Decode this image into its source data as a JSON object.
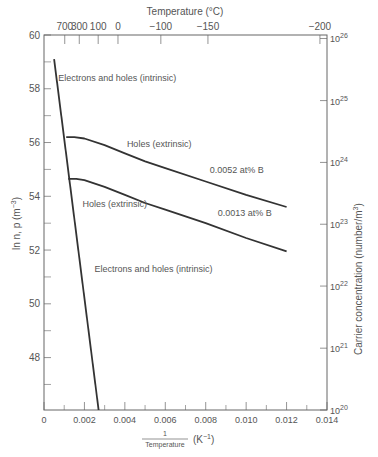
{
  "chart_data": {
    "type": "line",
    "title": "",
    "xlabel": "1/Temperature (K^-1)",
    "xlabel_parts": {
      "numerator": "1",
      "denominator": "Temperature",
      "unit": "(K",
      "unit_sup": "−1",
      "unit_close": ")"
    },
    "ylabel": "ln n, p (m^-3)",
    "ylabel_parts": {
      "main": "ln n, p (m",
      "sup": "−3",
      "close": ")"
    },
    "top_xlabel": "Temperature (°C)",
    "right_ylabel": "Carrier concentration (number/m^3)",
    "right_ylabel_parts": {
      "main": "Carrier concentration (number/m",
      "sup": "3",
      "close": ")"
    },
    "xlim": [
      0,
      0.014
    ],
    "ylim": [
      46.05,
      60
    ],
    "x_ticks": [
      "0",
      "0.002",
      "0.004",
      "0.006",
      "0.008",
      "0.010",
      "0.012",
      "0.014"
    ],
    "x_tick_values": [
      0,
      0.002,
      0.004,
      0.006,
      0.008,
      0.01,
      0.012,
      0.014
    ],
    "y_ticks": [
      "48",
      "50",
      "52",
      "54",
      "56",
      "58",
      "60"
    ],
    "y_tick_values": [
      48,
      50,
      52,
      54,
      56,
      58,
      60
    ],
    "top_ticks": [
      {
        "label": "700",
        "x": 0.001026
      },
      {
        "label": "300",
        "x": 0.001745
      },
      {
        "label": "100",
        "x": 0.00268
      },
      {
        "label": "0",
        "x": 0.00366
      },
      {
        "label": "−100",
        "x": 0.00578
      },
      {
        "label": "−150",
        "x": 0.00811
      },
      {
        "label": "−200",
        "x": 0.01365
      }
    ],
    "right_ticks": [
      {
        "base": "10",
        "exp": "20",
        "ln": 46.05
      },
      {
        "base": "10",
        "exp": "21",
        "ln": 48.35
      },
      {
        "base": "10",
        "exp": "22",
        "ln": 50.66
      },
      {
        "base": "10",
        "exp": "23",
        "ln": 52.96
      },
      {
        "base": "10",
        "exp": "24",
        "ln": 55.26
      },
      {
        "base": "10",
        "exp": "25",
        "ln": 57.56
      },
      {
        "base": "10",
        "exp": "26",
        "ln": 59.87
      }
    ],
    "series": [
      {
        "name": "Electrons and holes (intrinsic)",
        "x": [
          0.0005,
          0.0027
        ],
        "y": [
          59.1,
          46.05
        ]
      },
      {
        "name": "Holes (extrinsic) 0.0052 at% B",
        "x": [
          0.0011,
          0.0015,
          0.002,
          0.003,
          0.004,
          0.005,
          0.006,
          0.008,
          0.01,
          0.012
        ],
        "y": [
          56.2,
          56.2,
          56.15,
          55.9,
          55.6,
          55.3,
          55.05,
          54.55,
          54.05,
          53.6
        ]
      },
      {
        "name": "Holes (extrinsic) 0.0013 at% B",
        "x": [
          0.0012,
          0.0016,
          0.002,
          0.003,
          0.004,
          0.005,
          0.006,
          0.008,
          0.01,
          0.012
        ],
        "y": [
          54.65,
          54.65,
          54.6,
          54.35,
          54.05,
          53.75,
          53.5,
          53.0,
          52.45,
          51.95
        ]
      }
    ],
    "annotations": [
      {
        "text": "Electrons and holes (intrinsic)",
        "x": 0.0007,
        "y": 58.3
      },
      {
        "text": "Holes (extrinsic)",
        "x": 0.0041,
        "y": 55.85
      },
      {
        "text": "0.0052 at% B",
        "x": 0.0082,
        "y": 54.85
      },
      {
        "text": "Holes (extrinsic)",
        "x": 0.0019,
        "y": 53.6
      },
      {
        "text": "0.0013 at% B",
        "x": 0.0086,
        "y": 53.25
      },
      {
        "text": "Electrons and holes (intrinsic)",
        "x": 0.0025,
        "y": 51.2
      }
    ],
    "grid": false,
    "legend": "none"
  },
  "colors": {
    "axis": "#666666",
    "curve": "#333333",
    "text": "#555555",
    "background": "#ffffff"
  }
}
